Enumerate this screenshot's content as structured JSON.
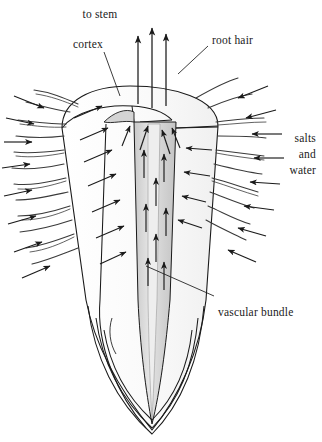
{
  "diagram": {
    "background_color": "#ffffff",
    "ink_color": "#1a1a1a",
    "vascular_fill": "#d8d8d8",
    "cortex_fill": "#fdfdfd",
    "labels": {
      "to_stem": "to stem",
      "cortex": "cortex",
      "root_hair": "root hair",
      "salts": "salts",
      "and": "and",
      "water": "water",
      "vascular_bundle": "vascular bundle"
    }
  }
}
